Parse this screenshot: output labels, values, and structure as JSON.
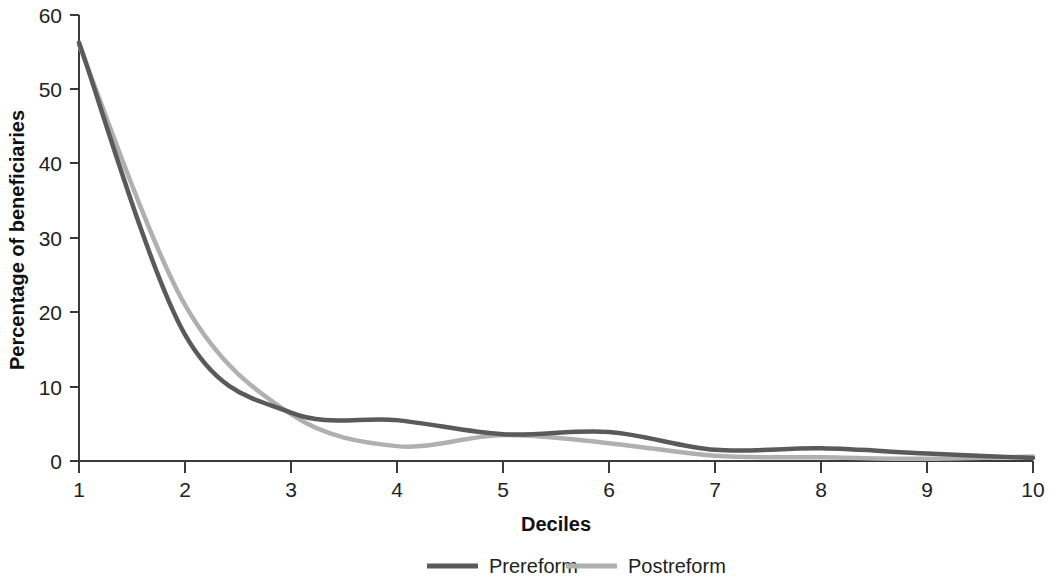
{
  "chart_data": {
    "type": "line",
    "title": "",
    "xlabel": "Deciles",
    "ylabel": "Percentage of beneficiaries",
    "x": [
      1,
      2,
      3,
      4,
      5,
      6,
      7,
      8,
      9,
      10
    ],
    "xticklabels": [
      "1",
      "2",
      "3",
      "4",
      "5",
      "6",
      "7",
      "8",
      "9",
      "10"
    ],
    "yticklabels": [
      "0",
      "10",
      "20",
      "30",
      "40",
      "50",
      "60"
    ],
    "yticks": [
      0,
      10,
      20,
      30,
      40,
      50,
      60
    ],
    "xlim": [
      1,
      10
    ],
    "ylim": [
      0,
      60
    ],
    "grid": false,
    "legend_position": "bottom",
    "series": [
      {
        "name": "Prereform",
        "color": "#5a5a5a",
        "values": [
          56.3,
          17.0,
          6.5,
          5.5,
          3.6,
          3.9,
          1.5,
          1.7,
          1.0,
          0.4
        ]
      },
      {
        "name": "Postreform",
        "color": "#b0b0b0",
        "values": [
          56.0,
          21.0,
          6.3,
          2.0,
          3.5,
          2.4,
          0.7,
          0.5,
          0.3,
          0.6
        ]
      }
    ]
  },
  "axes": {
    "y_title": "Percentage of beneficiaries",
    "x_title": "Deciles",
    "y_ticks": [
      "60",
      "50",
      "40",
      "30",
      "20",
      "10",
      "0"
    ],
    "x_ticks": [
      "1",
      "2",
      "3",
      "4",
      "5",
      "6",
      "7",
      "8",
      "9",
      "10"
    ]
  },
  "legend": {
    "items": [
      {
        "label": "Prereform",
        "color": "#5a5a5a"
      },
      {
        "label": "Postreform",
        "color": "#b0b0b0"
      }
    ]
  },
  "colors": {
    "prereform": "#5a5a5a",
    "postreform": "#b0b0b0",
    "axis": "#3a3a3a",
    "text": "#222222",
    "background": "#ffffff"
  }
}
